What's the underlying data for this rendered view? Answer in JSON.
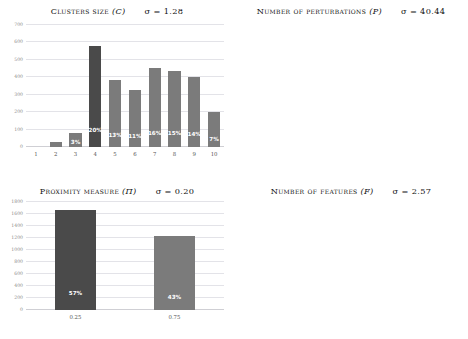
{
  "figure": {
    "background": "#ffffff",
    "bar_color": "#7b7b7b",
    "highlight_color": "#4a4a4a",
    "gridline_color": "#e3e3e8",
    "label_color": "#ffffff"
  },
  "panels": [
    {
      "id": "clusters-size",
      "title_text": "Clusters size",
      "title_symbol": "(C)",
      "sigma_text": "σ = 1.28"
    },
    {
      "id": "number-of-perturbations",
      "title_text": "Number of perturbations",
      "title_symbol": "(P)",
      "sigma_text": "σ = 40.44"
    },
    {
      "id": "proximity-measure",
      "title_text": "Proximity measure",
      "title_symbol": "(Π)",
      "sigma_text": "σ = 0.20"
    },
    {
      "id": "number-of-features",
      "title_text": "Number of features",
      "title_symbol": "(F)",
      "sigma_text": "σ = 2.57"
    }
  ],
  "chart_data": [
    {
      "type": "bar",
      "title": "Clusters size (C)  σ = 1.28",
      "xlabel": "",
      "ylabel": "",
      "categories": [
        "1",
        "2",
        "3",
        "4",
        "5",
        "6",
        "7",
        "8",
        "9",
        "10"
      ],
      "values": [
        0,
        30,
        80,
        580,
        385,
        330,
        455,
        435,
        400,
        200
      ],
      "data_labels": [
        "",
        "",
        "3%",
        "20%",
        "13%",
        "11%",
        "16%",
        "15%",
        "14%",
        "7%"
      ],
      "highlight_index": 3,
      "ylim": [
        0,
        700
      ],
      "yticks": [
        0,
        100,
        200,
        300,
        400,
        500,
        600,
        700
      ],
      "grid": true,
      "legend": "none"
    },
    {
      "type": "bar",
      "title": "Number of perturbations (P)  σ = 40.44",
      "xlabel": "",
      "ylabel": "",
      "categories": [
        "100",
        "150",
        "200"
      ],
      "values": [
        1280,
        390,
        1240
      ],
      "data_labels": [
        "44%",
        "13%",
        "43%"
      ],
      "highlight_index": 1,
      "ylim": [
        0,
        1400
      ],
      "yticks": [
        0,
        200,
        400,
        600,
        800,
        1000,
        1200,
        1400
      ],
      "grid": true,
      "legend": "none"
    },
    {
      "type": "bar",
      "title": "Proximity measure (Π)  σ = 0.20",
      "xlabel": "",
      "ylabel": "",
      "categories": [
        "0.25",
        "0.75"
      ],
      "values": [
        1660,
        1230
      ],
      "data_labels": [
        "57%",
        "43%"
      ],
      "highlight_index": 0,
      "ylim": [
        0,
        1800
      ],
      "yticks": [
        0,
        200,
        400,
        600,
        800,
        1000,
        1200,
        1400,
        1600,
        1800
      ],
      "grid": true,
      "legend": "none"
    },
    {
      "type": "bar",
      "title": "Number of features (F)  σ = 2.57",
      "xlabel": "",
      "ylabel": "",
      "categories": [
        "2",
        "4",
        "6",
        "8",
        "10",
        "12",
        "14",
        "16",
        "18"
      ],
      "values": [
        195,
        398,
        435,
        450,
        335,
        385,
        580,
        60,
        20
      ],
      "data_labels": [
        "7%",
        "14%",
        "15%",
        "16%",
        "11%",
        "13%",
        "20%",
        "1%",
        ""
      ],
      "highlight_index": 1,
      "ylim": [
        0,
        700
      ],
      "yticks": [
        0,
        100,
        200,
        300,
        400,
        500,
        600,
        700
      ],
      "grid": true,
      "legend": "none"
    }
  ]
}
